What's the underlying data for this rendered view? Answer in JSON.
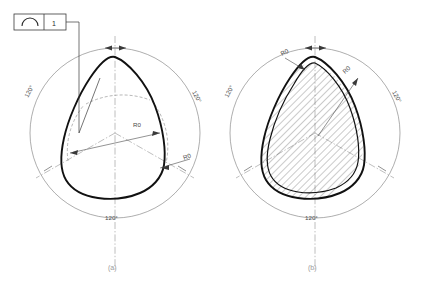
{
  "drawing": {
    "title": "Triangular profile cross-section drawing",
    "background_color": "#ffffff",
    "line_color": "#111111",
    "construction_color": "#7a7a7a",
    "dimension_color": "#4a4a4a"
  },
  "feature_control_frame": {
    "symbol_name": "profile-of-a-line",
    "tolerance_value": "1"
  },
  "figures": [
    {
      "id": "a",
      "caption": "(a)",
      "type": "solid-profile",
      "angles": [
        "120°",
        "120°",
        "120°"
      ],
      "dimensions": [
        {
          "name": "major-radius",
          "label": "R0"
        },
        {
          "name": "corner-radius",
          "label": "R0"
        }
      ]
    },
    {
      "id": "b",
      "caption": "(b)",
      "type": "hollow-hatched-tube",
      "angles": [
        "120°",
        "120°",
        "120°"
      ],
      "dimensions": [
        {
          "name": "wall-thickness",
          "label": "R0"
        },
        {
          "name": "inner-radius",
          "label": "R0"
        }
      ]
    }
  ]
}
